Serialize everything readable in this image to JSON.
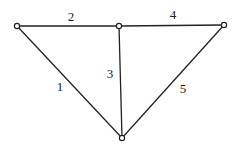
{
  "diagram": {
    "type": "graph",
    "nodes": [
      {
        "id": "A",
        "x": 17,
        "y": 26
      },
      {
        "id": "B",
        "x": 119,
        "y": 26
      },
      {
        "id": "C",
        "x": 224,
        "y": 25
      },
      {
        "id": "D",
        "x": 122,
        "y": 138
      }
    ],
    "edges": [
      {
        "label": "1",
        "from": "A",
        "to": "D",
        "lx": 60,
        "ly": 91
      },
      {
        "label": "2",
        "from": "A",
        "to": "B",
        "lx": 71,
        "ly": 21
      },
      {
        "label": "3",
        "from": "B",
        "to": "D",
        "lx": 110,
        "ly": 78
      },
      {
        "label": "4",
        "from": "B",
        "to": "C",
        "lx": 173,
        "ly": 19
      },
      {
        "label": "5",
        "from": "C",
        "to": "D",
        "lx": 183,
        "ly": 93
      }
    ]
  }
}
